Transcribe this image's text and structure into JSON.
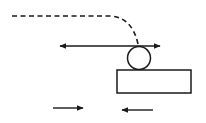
{
  "diagram": {
    "background": "#ffffff",
    "stroke_color": "#1a1a1a",
    "elements": {
      "dashed_path": {
        "kind": "dashed-curve",
        "description": "trajectory path curving down to ball"
      },
      "double_arrow": {
        "kind": "double-headed-arrow",
        "orientation": "horizontal"
      },
      "ball": {
        "kind": "circle"
      },
      "block": {
        "kind": "rectangle"
      },
      "arrow_right": {
        "kind": "arrow",
        "direction": "right"
      },
      "arrow_left": {
        "kind": "arrow",
        "direction": "left"
      }
    }
  }
}
